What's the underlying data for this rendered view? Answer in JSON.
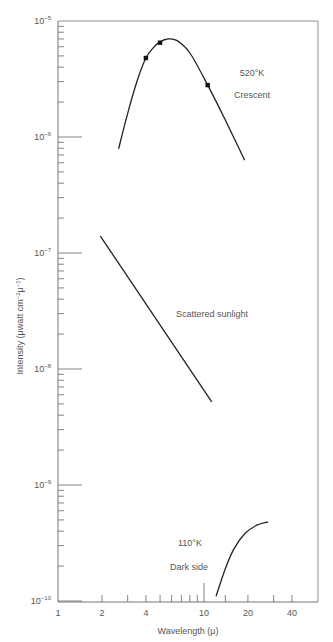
{
  "chart_data": {
    "type": "line",
    "title": "",
    "xlabel": "Wavelength (μ)",
    "ylabel": "Intensity (μwatt cm⁻²μ⁻¹)",
    "xscale": "log",
    "yscale": "log",
    "xlim": [
      1,
      60
    ],
    "ylim": [
      1e-10,
      1e-05
    ],
    "grid": false,
    "x_ticks": [
      1,
      2,
      4,
      10,
      20,
      40
    ],
    "x_tick_labels": [
      "1",
      "2",
      "4",
      "10",
      "20",
      "40"
    ],
    "x_minor_ticks": [
      2,
      3,
      4,
      5,
      6,
      7,
      8,
      9,
      10,
      14,
      20,
      30,
      40
    ],
    "y_ticks": [
      1e-10,
      1e-09,
      1e-08,
      1e-07,
      1e-06,
      1e-05
    ],
    "y_tick_labels": [
      {
        "base": "10",
        "exp": "−10"
      },
      {
        "base": "10",
        "exp": "−9"
      },
      {
        "base": "10",
        "exp": "−8"
      },
      {
        "base": "10",
        "exp": "−7"
      },
      {
        "base": "10",
        "exp": "−6"
      },
      {
        "base": "10",
        "exp": "−5"
      }
    ],
    "series": [
      {
        "name": "Crescent 520°K",
        "style": "curve",
        "x": [
          2.6,
          3.0,
          3.5,
          4.0,
          4.5,
          5.0,
          5.6,
          6.5,
          8.0,
          10.6,
          14.0,
          19.0
        ],
        "y": [
          7.9e-07,
          1.6e-06,
          3.1e-06,
          4.8e-06,
          5.9e-06,
          6.6e-06,
          7e-06,
          6.8e-06,
          5.3e-06,
          2.8e-06,
          1.4e-06,
          6.3e-07
        ],
        "markers": {
          "x": [
            4.0,
            5.0,
            10.6
          ],
          "y": [
            4.8e-06,
            6.5e-06,
            2.8e-06
          ]
        }
      },
      {
        "name": "Scattered sunlight",
        "style": "line",
        "x": [
          1.95,
          11.3
        ],
        "y": [
          1.4e-07,
          5.2e-09
        ]
      },
      {
        "name": "Dark side 110°K",
        "style": "curve",
        "x": [
          12.1,
          14.0,
          16.0,
          19.0,
          23.0,
          27.4
        ],
        "y": [
          1.1e-10,
          1.9e-10,
          2.8e-10,
          3.8e-10,
          4.5e-10,
          4.8e-10
        ]
      }
    ],
    "annotations": [
      {
        "text": "520°K",
        "x": 22,
        "y": 3.5e-06
      },
      {
        "text": "Crescent",
        "x": 22,
        "y": 2.3e-06
      },
      {
        "text": "Scattered sunlight",
        "x": 16,
        "y": 2.2e-08
      },
      {
        "text": "110°K",
        "x": 10,
        "y": 2.3e-10
      },
      {
        "text": "Dark side",
        "x": 10,
        "y": 1.5e-10
      }
    ],
    "legend": "none (inline annotations)"
  },
  "labels": {
    "xlabel": "Wavelength (μ)",
    "ylabel_main": "Intensity (",
    "ylabel_unit": "μwatt cm",
    "ylabel_exp1": "−2",
    "ylabel_mu": "μ",
    "ylabel_exp2": "−1",
    "ylabel_close": ")",
    "ann_crescent_temp": "520°K",
    "ann_crescent": "Crescent",
    "ann_sunlight": "Scattered sunlight",
    "ann_dark_temp": "110°K",
    "ann_dark": "Dark side"
  },
  "colors": {
    "axis": "#666666",
    "curve": "#222222",
    "text": "#555555"
  }
}
